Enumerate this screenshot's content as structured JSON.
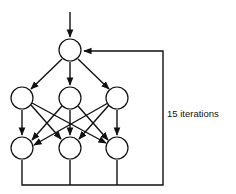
{
  "diagram": {
    "loop_label": "15 iterations",
    "colors": {
      "stroke": "#111111",
      "fill": "#ffffff"
    },
    "nodes": {
      "top": [
        {
          "id": "top"
        }
      ],
      "middle": [
        {
          "id": "mid-left"
        },
        {
          "id": "mid-center"
        },
        {
          "id": "mid-right"
        }
      ],
      "bottom": [
        {
          "id": "bot-left"
        },
        {
          "id": "bot-center"
        },
        {
          "id": "bot-right"
        }
      ]
    }
  }
}
